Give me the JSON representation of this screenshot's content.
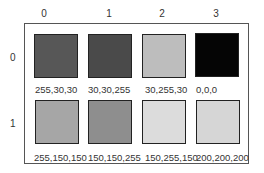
{
  "columns": [
    "0",
    "1",
    "2",
    "3"
  ],
  "rows": [
    "0",
    "1"
  ],
  "swatches": [
    [
      {
        "label": "255,30,30",
        "gray": "#575757"
      },
      {
        "label": "30,30,255",
        "gray": "#4a4a4a"
      },
      {
        "label": "30,255,30",
        "gray": "#bdbdbd"
      },
      {
        "label": "0,0,0",
        "gray": "#050505"
      }
    ],
    [
      {
        "label": "255,150,150",
        "gray": "#a6a6a6"
      },
      {
        "label": "150,150,255",
        "gray": "#8e8e8e"
      },
      {
        "label": "150,255,150",
        "gray": "#dcdcdc"
      },
      {
        "label": "200,200,200",
        "gray": "#d6d6d6"
      }
    ]
  ]
}
